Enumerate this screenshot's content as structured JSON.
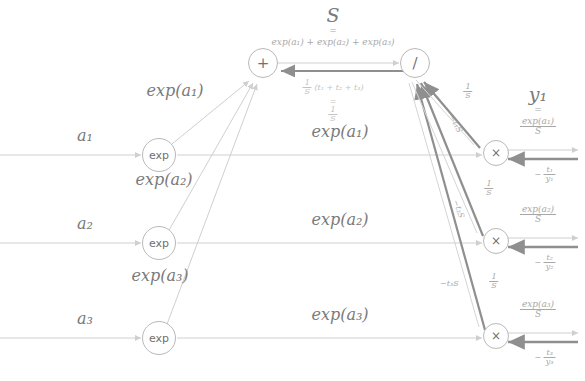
{
  "diagram": {
    "title_top": "S",
    "title_top_eq": "=",
    "title_top_expr": "exp(a₁) + exp(a₂) + exp(a₃)",
    "y_label": "y₁",
    "y_label_eq": "=",
    "y_num": "exp(a₁)",
    "y_den": "S"
  },
  "nodes": {
    "plus": "+",
    "divide": "/",
    "exp1": "exp",
    "exp2": "exp",
    "exp3": "exp",
    "mul1": "×",
    "mul2": "×",
    "mul3": "×"
  },
  "inputs": [
    {
      "label": "a₁"
    },
    {
      "label": "a₂"
    },
    {
      "label": "a₃"
    }
  ],
  "forward_labels": {
    "exp_out_1": "exp(a₁)",
    "exp_out_2": "exp(a₂)",
    "exp_out_3": "exp(a₃)",
    "mid_1": "exp(a₁)",
    "mid_2": "exp(a₂)",
    "mid_3": "exp(a₃)",
    "out_1_num": "exp(a₁)",
    "out_1_den": "S",
    "out_2_num": "exp(a₂)",
    "out_2_den": "S",
    "out_3_num": "exp(a₃)",
    "out_3_den": "S"
  },
  "gradients": {
    "sum_grad_num": "1",
    "sum_grad_den": "S",
    "sum_grad_paren": "(t₁ + t₂ + t₃)",
    "sum_grad_eq": "=",
    "sum_grad_simple_num": "1",
    "sum_grad_simple_den": "S",
    "branch_1_num": "1",
    "branch_1_den": "S",
    "branch_2_num": "1",
    "branch_2_den": "S",
    "branch_3_num": "1",
    "branch_3_den": "S",
    "diag_1": "−t₁S",
    "diag_2": "−t₂S",
    "diag_3": "−t₃S",
    "out_grad_1_sign": "−",
    "out_grad_1_num": "t₁",
    "out_grad_1_den": "y₁",
    "out_grad_2_sign": "−",
    "out_grad_2_num": "t₂",
    "out_grad_2_den": "y₂",
    "out_grad_3_sign": "−",
    "out_grad_3_num": "t₃",
    "out_grad_3_den": "y₃"
  },
  "colors": {
    "forward_line": "#cfcfcf",
    "backward_line": "#8f8f8f",
    "node_stroke": "#b9b9b9",
    "text": "#7a7a7a",
    "background": "#ffffff"
  }
}
